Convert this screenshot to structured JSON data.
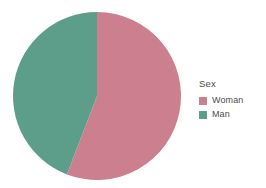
{
  "chart_data": {
    "type": "pie",
    "title": "",
    "xlabel": "",
    "ylabel": "",
    "categories": [
      "Woman",
      "Man"
    ],
    "values": [
      55.8,
      44.2
    ],
    "value_unit": "percent",
    "start_angle_deg": 0,
    "direction": "clockwise",
    "legend_position": "right",
    "grid": false,
    "slices": [
      {
        "label": "Woman",
        "value": 55.8,
        "start_angle_deg": 0,
        "end_angle_deg": 201,
        "color": "#cc7f8e"
      },
      {
        "label": "Man",
        "value": 44.2,
        "start_angle_deg": 201,
        "end_angle_deg": 360,
        "color": "#5d9e8b"
      }
    ]
  },
  "legend": {
    "title": "Sex",
    "items": [
      {
        "label": "Woman",
        "color": "#cc7f8e"
      },
      {
        "label": "Man",
        "color": "#5d9e8b"
      }
    ]
  },
  "canvas": {
    "background": "#ffffff",
    "center_x": 97,
    "center_y": 96,
    "radius": 84
  }
}
